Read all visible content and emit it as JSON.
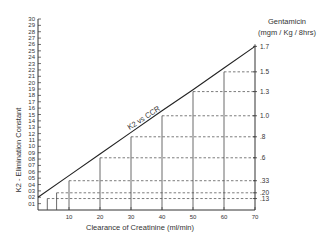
{
  "chart_data": {
    "type": "line",
    "title": "",
    "xlabel": "Clearance of Creatinine (ml/min)",
    "ylabel": "K2 - Elimination Constant",
    "right_axis_title_line1": "Gentamicin",
    "right_axis_title_line2": "(mgm / Kg / 8hrs)",
    "line_label": "K2 vs CCR",
    "xlim": [
      0,
      70
    ],
    "ylim": [
      0,
      0.3
    ],
    "x_ticks": [
      10,
      20,
      30,
      40,
      50,
      60,
      70
    ],
    "x_tick_labels": [
      "10",
      "20",
      "30",
      "40",
      "50",
      "60",
      "70"
    ],
    "y_ticks": [
      0.01,
      0.02,
      0.03,
      0.04,
      0.05,
      0.06,
      0.07,
      0.08,
      0.09,
      0.1,
      0.11,
      0.12,
      0.13,
      0.14,
      0.15,
      0.16,
      0.17,
      0.18,
      0.19,
      0.2,
      0.21,
      0.22,
      0.23,
      0.24,
      0.25,
      0.26,
      0.27,
      0.28,
      0.29,
      0.3
    ],
    "y_tick_labels": [
      "01",
      "02",
      "03",
      "04",
      "05",
      "06",
      "07",
      "08",
      "09",
      "10",
      "11",
      "12",
      "13",
      "14",
      "15",
      "16",
      "17",
      "18",
      "19",
      "20",
      "21",
      "22",
      "23",
      "24",
      "25",
      "26",
      "27",
      "28",
      "29",
      "30"
    ],
    "series": [
      {
        "name": "K2 vs CCR",
        "x": [
          0,
          10,
          20,
          30,
          40,
          50,
          60,
          70
        ],
        "y": [
          0.02,
          0.054,
          0.088,
          0.122,
          0.156,
          0.189,
          0.223,
          0.257
        ]
      }
    ],
    "reference_lines": [
      {
        "clearance": 70,
        "k2": 0.257,
        "dose_label": "1.7"
      },
      {
        "clearance": 60,
        "k2": 0.217,
        "dose_label": "1.5"
      },
      {
        "clearance": 50,
        "k2": 0.186,
        "dose_label": "1.3"
      },
      {
        "clearance": 40,
        "k2": 0.148,
        "dose_label": "1.0"
      },
      {
        "clearance": 30,
        "k2": 0.115,
        "dose_label": ".8"
      },
      {
        "clearance": 20,
        "k2": 0.082,
        "dose_label": ".6"
      },
      {
        "clearance": 10,
        "k2": 0.046,
        "dose_label": ".33"
      },
      {
        "clearance": 6,
        "k2": 0.027,
        "dose_label": ".20"
      },
      {
        "clearance": 3,
        "k2": 0.018,
        "dose_label": ".13"
      }
    ],
    "grid": false,
    "legend": "none"
  }
}
